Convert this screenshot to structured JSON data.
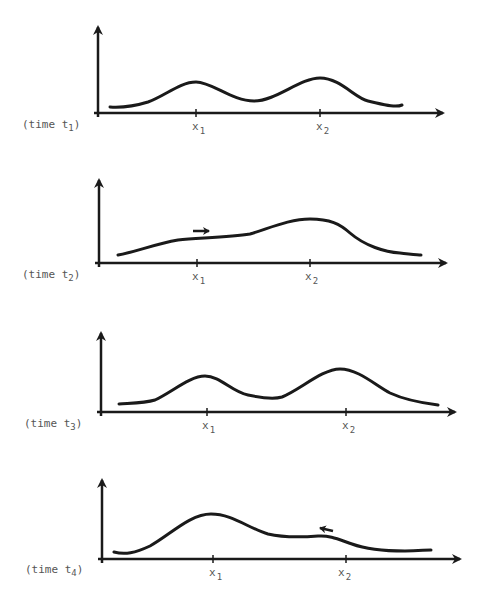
{
  "figure": {
    "stroke_color": "#1a1a1a",
    "label_color": "#555555"
  },
  "panels": [
    {
      "time_label": "(time t",
      "time_sub": "1",
      "time_close": ")",
      "x1_label": "x",
      "x1_sub": "1",
      "x2_label": "x",
      "x2_sub": "2",
      "arrow_hint": "none"
    },
    {
      "time_label": "(time t",
      "time_sub": "2",
      "time_close": ")",
      "x1_label": "x",
      "x1_sub": "1",
      "x2_label": "x",
      "x2_sub": "2",
      "arrow_hint": "right"
    },
    {
      "time_label": "(time t",
      "time_sub": "3",
      "time_close": ")",
      "x1_label": "x",
      "x1_sub": "1",
      "x2_label": "x",
      "x2_sub": "2",
      "arrow_hint": "none"
    },
    {
      "time_label": "(time t",
      "time_sub": "4",
      "time_close": ")",
      "x1_label": "x",
      "x1_sub": "1",
      "x2_label": "x",
      "x2_sub": "2",
      "arrow_hint": "left"
    }
  ]
}
